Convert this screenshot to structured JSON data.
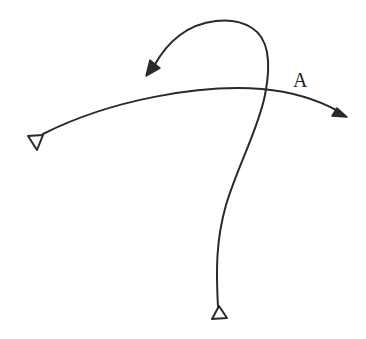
{
  "diagram": {
    "type": "trajectory-diagram",
    "stroke_color": "#2a2a2a",
    "background": "#ffffff",
    "labels": [
      {
        "id": "label-a",
        "text": "A",
        "x": 300,
        "y": 87
      }
    ],
    "paths": [
      {
        "id": "horizontal-arc",
        "description": "Curved path from left station triangle arcing right to arrowhead",
        "start_marker": "triangle-down-open",
        "end_marker": "filled-arrow"
      },
      {
        "id": "looping-curve",
        "description": "Path from bottom station triangle rising, crossing the arc, then looping back left to arrowhead",
        "start_marker": "triangle-up-open",
        "end_marker": "filled-arrow"
      }
    ],
    "markers": [
      {
        "id": "left-station",
        "shape": "open triangle pointing down",
        "x": 36,
        "y": 142
      },
      {
        "id": "bottom-station",
        "shape": "open triangle pointing up",
        "x": 219,
        "y": 313
      }
    ]
  }
}
